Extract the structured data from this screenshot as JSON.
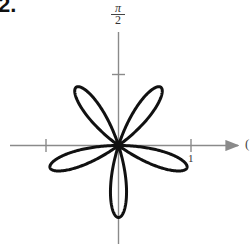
{
  "problem": {
    "number": "2."
  },
  "chart_data": {
    "type": "line",
    "subtype": "polar",
    "title": "",
    "equation_inferred": "r = -sin(5θ)",
    "petals": 5,
    "petal_length": 1,
    "petal_directions_deg": [
      -90,
      -18,
      54,
      126,
      198
    ],
    "axes": {
      "polar_axis_label": "0",
      "vertical_axis_label": {
        "numerator": "π",
        "denominator": "2"
      },
      "tick_labels": [
        "1"
      ],
      "ticks": [
        -1,
        1
      ],
      "range": [
        -1.6,
        1.6
      ]
    },
    "grid": false,
    "legend": null,
    "colors": {
      "curve": "#111111",
      "axis": "#8a8a8a"
    }
  },
  "labels": {
    "pi_numerator": "π",
    "pi_denominator": "2",
    "tick_one": "1",
    "polar_axis": "("
  }
}
